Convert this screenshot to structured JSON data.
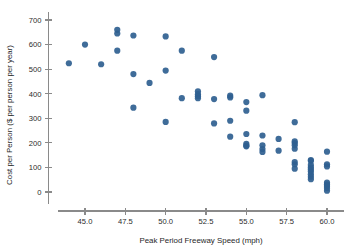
{
  "chart_data": {
    "type": "scatter",
    "title": "",
    "xlabel": "Peak Period Freeway Speed (mph)",
    "ylabel": "Cost per Person ($ per person per year)",
    "xlim": [
      43.2,
      61.0
    ],
    "ylim": [
      -30,
      720
    ],
    "grid": false,
    "legend": null,
    "marker_color": "#2f5f90",
    "marker_size_px": 3.1,
    "xticks": [
      45.0,
      47.5,
      50.0,
      52.5,
      55.0,
      57.5,
      60.0
    ],
    "xtick_labels": [
      "45.0",
      "47.5",
      "50.0",
      "52.5",
      "55.0",
      "57.5",
      "60.0"
    ],
    "yticks": [
      0,
      100,
      200,
      300,
      400,
      500,
      600,
      700
    ],
    "ytick_labels": [
      "0",
      "100",
      "200",
      "300",
      "400",
      "500",
      "600",
      "700"
    ],
    "x": [
      44.0,
      45.0,
      46.0,
      47.0,
      47.0,
      47.0,
      48.0,
      48.0,
      48.0,
      49.0,
      50.0,
      50.0,
      50.0,
      51.0,
      51.0,
      52.0,
      52.0,
      52.0,
      52.0,
      53.0,
      53.0,
      53.0,
      54.0,
      54.0,
      54.0,
      54.0,
      55.0,
      55.0,
      55.0,
      55.0,
      55.0,
      55.0,
      56.0,
      56.0,
      56.0,
      56.0,
      56.0,
      57.0,
      57.0,
      58.0,
      58.0,
      58.0,
      58.0,
      58.0,
      58.0,
      58.0,
      58.0,
      59.0,
      59.0,
      59.0,
      59.0,
      59.0,
      59.0,
      59.0,
      59.0,
      59.0,
      60.0,
      60.0,
      60.0,
      60.0,
      60.0,
      60.0,
      60.0,
      60.0
    ],
    "y": [
      524,
      600,
      520,
      660,
      645,
      575,
      637,
      480,
      343,
      444,
      633,
      494,
      285,
      575,
      382,
      410,
      398,
      390,
      382,
      549,
      378,
      279,
      392,
      385,
      290,
      225,
      366,
      331,
      236,
      196,
      189,
      186,
      394,
      230,
      190,
      175,
      163,
      216,
      168,
      284,
      206,
      199,
      190,
      176,
      122,
      113,
      95,
      130,
      127,
      110,
      100,
      92,
      83,
      72,
      62,
      52,
      164,
      113,
      104,
      38,
      31,
      24,
      16,
      5
    ],
    "points": [
      {
        "x": 44.0,
        "y": 524
      },
      {
        "x": 45.0,
        "y": 600
      },
      {
        "x": 46.0,
        "y": 520
      },
      {
        "x": 47.0,
        "y": 660
      },
      {
        "x": 47.0,
        "y": 645
      },
      {
        "x": 47.0,
        "y": 575
      },
      {
        "x": 48.0,
        "y": 637
      },
      {
        "x": 48.0,
        "y": 480
      },
      {
        "x": 48.0,
        "y": 343
      },
      {
        "x": 49.0,
        "y": 444
      },
      {
        "x": 50.0,
        "y": 633
      },
      {
        "x": 50.0,
        "y": 494
      },
      {
        "x": 50.0,
        "y": 285
      },
      {
        "x": 51.0,
        "y": 575
      },
      {
        "x": 51.0,
        "y": 382
      },
      {
        "x": 52.0,
        "y": 410
      },
      {
        "x": 52.0,
        "y": 398
      },
      {
        "x": 52.0,
        "y": 390
      },
      {
        "x": 52.0,
        "y": 382
      },
      {
        "x": 53.0,
        "y": 549
      },
      {
        "x": 53.0,
        "y": 378
      },
      {
        "x": 53.0,
        "y": 279
      },
      {
        "x": 54.0,
        "y": 392
      },
      {
        "x": 54.0,
        "y": 385
      },
      {
        "x": 54.0,
        "y": 290
      },
      {
        "x": 54.0,
        "y": 225
      },
      {
        "x": 55.0,
        "y": 366
      },
      {
        "x": 55.0,
        "y": 331
      },
      {
        "x": 55.0,
        "y": 236
      },
      {
        "x": 55.0,
        "y": 196
      },
      {
        "x": 55.0,
        "y": 189
      },
      {
        "x": 55.0,
        "y": 186
      },
      {
        "x": 56.0,
        "y": 394
      },
      {
        "x": 56.0,
        "y": 230
      },
      {
        "x": 56.0,
        "y": 190
      },
      {
        "x": 56.0,
        "y": 175
      },
      {
        "x": 56.0,
        "y": 163
      },
      {
        "x": 57.0,
        "y": 216
      },
      {
        "x": 57.0,
        "y": 168
      },
      {
        "x": 58.0,
        "y": 284
      },
      {
        "x": 58.0,
        "y": 206
      },
      {
        "x": 58.0,
        "y": 199
      },
      {
        "x": 58.0,
        "y": 190
      },
      {
        "x": 58.0,
        "y": 176
      },
      {
        "x": 58.0,
        "y": 122
      },
      {
        "x": 58.0,
        "y": 113
      },
      {
        "x": 58.0,
        "y": 95
      },
      {
        "x": 59.0,
        "y": 130
      },
      {
        "x": 59.0,
        "y": 127
      },
      {
        "x": 59.0,
        "y": 110
      },
      {
        "x": 59.0,
        "y": 100
      },
      {
        "x": 59.0,
        "y": 92
      },
      {
        "x": 59.0,
        "y": 83
      },
      {
        "x": 59.0,
        "y": 72
      },
      {
        "x": 59.0,
        "y": 62
      },
      {
        "x": 59.0,
        "y": 52
      },
      {
        "x": 60.0,
        "y": 164
      },
      {
        "x": 60.0,
        "y": 113
      },
      {
        "x": 60.0,
        "y": 104
      },
      {
        "x": 60.0,
        "y": 38
      },
      {
        "x": 60.0,
        "y": 31
      },
      {
        "x": 60.0,
        "y": 24
      },
      {
        "x": 60.0,
        "y": 16
      },
      {
        "x": 60.0,
        "y": 5
      }
    ]
  }
}
